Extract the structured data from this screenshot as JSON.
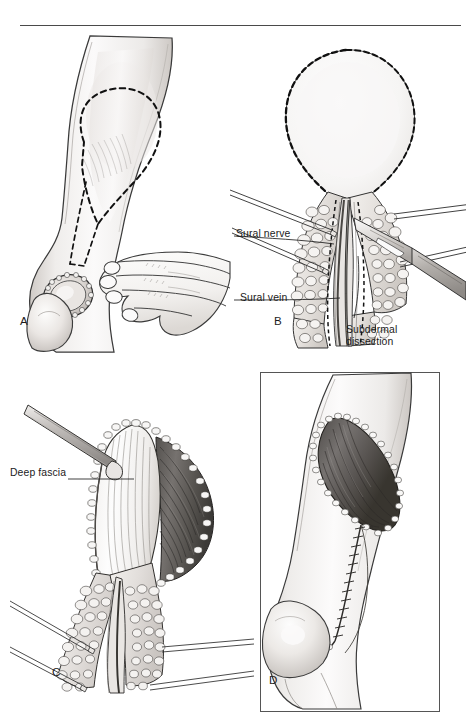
{
  "figure": {
    "kind": "surgical-technique-illustration",
    "style": "grayscale pen-and-ink medical illustration",
    "panel_count": 4,
    "top_rule": true
  },
  "panels": [
    {
      "letter": "A",
      "name": "flap-design-and-palpation",
      "caption_text": "A",
      "description": "Posterior lower leg in lateral view. A teardrop shaped flap is outlined with a dashed line over the calf; the narrow pedicle tapers distally toward the popliteal defect. A surgeon's hand palpates the leg beside the marked flap. The recipient defect is drawn as a stippled oval wound over the prominence below the knee.",
      "labels": [],
      "elements": [
        "leg-outline",
        "dashed-flap-outline",
        "dashed-pedicle-limbs",
        "stippled-wound-defect",
        "palpating-hand"
      ]
    },
    {
      "letter": "B",
      "name": "subdermal-dissection",
      "caption_text": "B",
      "description": "The teardrop flap has been incised and raised; the wound edges are retracted with hooks showing the cobblestoned subcutaneous fat. A scalpel performs subdermal dissection of the pedicle. The sural nerve and sural vein run in the midline of the pedicle.",
      "labels": [
        {
          "id": "sural-nerve",
          "text": "Sural nerve",
          "lines": [
            "Sural nerve"
          ]
        },
        {
          "id": "sural-vein",
          "text": "Sural vein",
          "lines": [
            "Sural vein"
          ]
        },
        {
          "id": "subdermal-dissection",
          "text": "Subdermal dissection",
          "lines": [
            "Subdermal",
            "dissection"
          ]
        }
      ],
      "elements": [
        "dashed-flap-outline",
        "retraction-hooks",
        "subcutaneous-fat-cobblestone",
        "scalpel",
        "sural-nerve-strand",
        "sural-vein-strand"
      ]
    },
    {
      "letter": "C",
      "name": "flap-elevation-deep-fascia",
      "caption_text": "C",
      "description": "The flap is elevated and reflected, exposing the glistening deep fascia on its undersurface and the striated gastrocnemius muscle in the donor bed. A blunt dissector / retractor lifts the proximal corner of the flap. Retraction hooks hold the subcutaneous fat of the pedicle wound open.",
      "labels": [
        {
          "id": "deep-fascia",
          "text": "Deep fascia",
          "lines": [
            "Deep fascia"
          ]
        }
      ],
      "elements": [
        "elevated-flap",
        "deep-fascia-surface",
        "exposed-muscle",
        "blunt-dissector",
        "retraction-hooks",
        "subcutaneous-fat-cobblestone"
      ]
    },
    {
      "letter": "D",
      "name": "inset-flap-closure",
      "caption_text": "D",
      "description": "Boxed inset. The flap has been transposed distally and sutured into the popliteal defect; the muscle shows through the opened donor area superiorly, and a running suture line runs along the closed pedicle track down onto the knee prominence.",
      "boxed": true,
      "labels": [],
      "elements": [
        "leg-outline",
        "transposed-flap",
        "exposed-muscle",
        "running-suture-line",
        "knee-prominence"
      ]
    }
  ],
  "colors": {
    "background": "#ffffff",
    "ink": "#1a1a1a",
    "rule": "#4a4a4a",
    "box_border": "#555555",
    "skin_light": "#f7f6f5",
    "skin_mid": "#e6e3e0",
    "skin_shadow": "#c9c4c0",
    "muscle_dark": "#6e6a68",
    "muscle_mid": "#9a9593",
    "fat_fill": "#efedea",
    "metal_light": "#e9e7e5",
    "metal_mid": "#b8b4b1"
  }
}
